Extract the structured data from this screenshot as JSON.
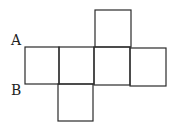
{
  "diagram": {
    "type": "cube-net",
    "stroke_color": "#2a2a2a",
    "background": "#ffffff",
    "labels": {
      "a": "A",
      "b": "B"
    },
    "squares": [
      {
        "name": "top",
        "x": 95,
        "y": 10,
        "w": 36,
        "h": 37
      },
      {
        "name": "row-1",
        "x": 25,
        "y": 47,
        "w": 34,
        "h": 37
      },
      {
        "name": "row-2",
        "x": 59,
        "y": 47,
        "w": 35,
        "h": 37
      },
      {
        "name": "row-3",
        "x": 94,
        "y": 47,
        "w": 36,
        "h": 38
      },
      {
        "name": "row-4",
        "x": 130,
        "y": 48,
        "w": 36,
        "h": 38
      },
      {
        "name": "bottom",
        "x": 58,
        "y": 84,
        "w": 35,
        "h": 37
      }
    ]
  }
}
